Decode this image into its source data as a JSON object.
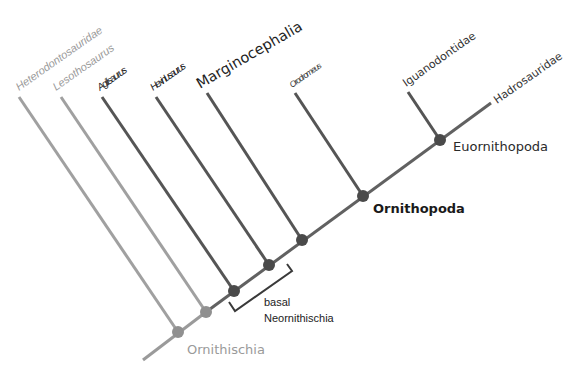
{
  "diagram": {
    "type": "cladogram",
    "colors": {
      "light_gray": "#9a9a9a",
      "mid_gray": "#6e6e6e",
      "dark_gray": "#555555",
      "text_dark": "#1e1e1e"
    },
    "taxa": {
      "heterodontosauridae": "Heterodontosauridae",
      "lesothosaurus": "Lesothosaurus",
      "agilisaurus": "Agilisaurus",
      "hexinlusaurus": "Hexinlusaurus",
      "marginocephalia": "Marginocephalia",
      "orodromeus": "Orodromeus",
      "iguanodontidae": "Iguanodontidae",
      "hadrosauridae": "Hadrosauridae"
    },
    "clades": {
      "ornithischia": "Ornithischia",
      "ornithopoda": "Ornithopoda",
      "euornithopoda": "Euornithopoda",
      "basal_line1": "basal",
      "basal_line2": "Neornithischia"
    }
  }
}
